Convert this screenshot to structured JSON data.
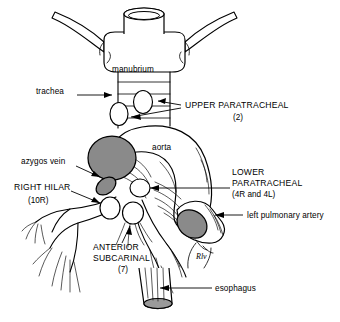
{
  "figure": {
    "background_color": "#ffffff",
    "line_color": "#000000",
    "node_shaded_color": "#8a8a8a",
    "node_unshaded_color": "#ffffff"
  },
  "labels": {
    "manubrium": "manubrium",
    "trachea": "trachea",
    "upper_paratracheal": "UPPER PARATRACHEAL",
    "upper_paratracheal_station": "(2)",
    "azygos_vein": "azygos vein",
    "aorta": "aorta",
    "right_hilar": "RIGHT HILAR",
    "right_hilar_station": "(10R)",
    "lower_paratracheal_line1": "LOWER",
    "lower_paratracheal_line2": "PARATRACHEAL",
    "lower_paratracheal_station": "(4R and 4L)",
    "left_pulmonary_artery": "left pulmonary artery",
    "anterior_subcarinal_line1": "ANTERIOR",
    "anterior_subcarinal_line2": "SUBCARINAL",
    "anterior_subcarinal_station": "(7)",
    "esophagus": "esophagus",
    "rlv_marker": "Rlv"
  },
  "nodes": [
    {
      "name": "upper-paratracheal-right",
      "station": "2",
      "shaded": false
    },
    {
      "name": "upper-paratracheal-left",
      "station": "2",
      "shaded": false
    },
    {
      "name": "azygos-vein-node",
      "station": "azygos",
      "shaded": true
    },
    {
      "name": "right-hilar-node",
      "station": "10R",
      "shaded": false
    },
    {
      "name": "lower-paratracheal-node",
      "station": "4R and 4L",
      "shaded": false
    },
    {
      "name": "anterior-subcarinal-node",
      "station": "7",
      "shaded": false
    },
    {
      "name": "left-pulmonary-artery-node",
      "station": "left pulmonary artery",
      "shaded": true
    },
    {
      "name": "aortic-arch-node",
      "station": "aorta",
      "shaded": true
    }
  ]
}
